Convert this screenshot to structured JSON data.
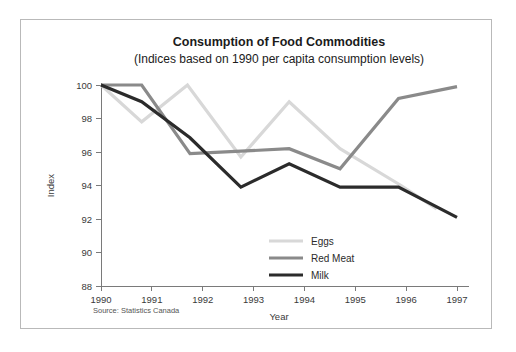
{
  "figure": {
    "source_note": "Source: Statistics Canada",
    "border_color": "#b9b9b9",
    "background": "#ffffff"
  },
  "chart_data": {
    "type": "line",
    "title": "Consumption of Food Commodities",
    "subtitle": "(Indices based on 1990 per capita consumption levels)",
    "xlabel": "Year",
    "ylabel": "Index",
    "x": [
      1990,
      1991,
      1992,
      1993,
      1994,
      1995,
      1996,
      1997
    ],
    "xtick_labels": [
      "1990",
      "1991",
      "1992",
      "1993",
      "1994",
      "1995",
      "1996",
      "1997"
    ],
    "ytick_labels": [
      "88",
      "90",
      "92",
      "94",
      "96",
      "98",
      "100"
    ],
    "yticks": [
      88,
      90,
      92,
      94,
      96,
      98,
      100
    ],
    "xlim": [
      1990,
      1997
    ],
    "ylim": [
      88,
      100
    ],
    "grid": false,
    "legend_position": "inside-lower-center",
    "series": [
      {
        "name": "Eggs",
        "color": "#d8d8d8",
        "width": 3.2,
        "values": [
          100,
          97.8,
          100,
          95.7,
          99,
          96.2,
          94,
          null
        ],
        "vertices": [
          [
            1990,
            100
          ],
          [
            1990.8,
            97.8
          ],
          [
            1991.7,
            100
          ],
          [
            1992.75,
            95.7
          ],
          [
            1993.7,
            99
          ],
          [
            1994.7,
            96.2
          ],
          [
            1995.9,
            94
          ],
          [
            1996.6,
            92.6
          ]
        ]
      },
      {
        "name": "Red Meat",
        "color": "#8a8a8a",
        "width": 3.2,
        "values": [
          100,
          100,
          96,
          96,
          96.2,
          95,
          99.2,
          99.9
        ],
        "vertices": [
          [
            1990,
            100
          ],
          [
            1990.8,
            100
          ],
          [
            1991.75,
            95.9
          ],
          [
            1992.75,
            96.05
          ],
          [
            1993.7,
            96.2
          ],
          [
            1994.7,
            95.0
          ],
          [
            1995.85,
            99.2
          ],
          [
            1997,
            99.9
          ]
        ]
      },
      {
        "name": "Milk",
        "color": "#2b2b2b",
        "width": 3.2,
        "values": [
          100,
          99,
          96.8,
          94,
          95.3,
          94,
          94,
          92.1
        ],
        "vertices": [
          [
            1990,
            100
          ],
          [
            1990.8,
            99.0
          ],
          [
            1991.75,
            96.85
          ],
          [
            1992.75,
            93.9
          ],
          [
            1993.7,
            95.3
          ],
          [
            1994.7,
            93.9
          ],
          [
            1995.85,
            93.9
          ],
          [
            1997,
            92.1
          ]
        ]
      }
    ]
  }
}
